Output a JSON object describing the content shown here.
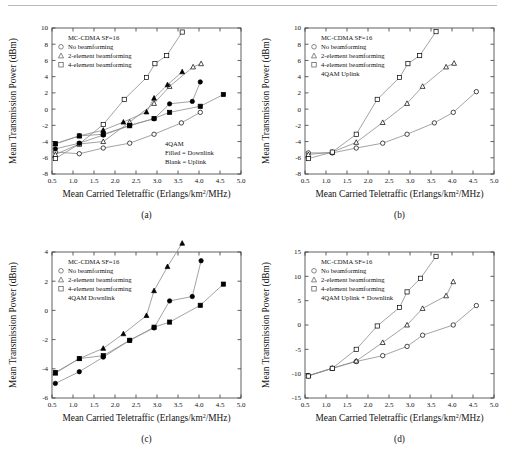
{
  "figure": {
    "axis_x_label": "Mean Carried Teletraffic (Erlangs/km",
    "axis_x_label_sup": "2",
    "axis_x_label_tail": "/MHz)",
    "axis_y_label": "Mean Transmission Power (dBm)",
    "line_color": "#8c8c8c",
    "marker_color": "#000000"
  },
  "panels": [
    {
      "caption": "(a)",
      "legend_title": "MC-CDMA SF=16",
      "legend_items": [
        {
          "marker": "circle-icon",
          "label": "No beamforming"
        },
        {
          "marker": "triangle-icon",
          "label": "2-element beamforming"
        },
        {
          "marker": "square-icon",
          "label": "4-element beamforming"
        }
      ],
      "annotation": [
        "4QAM",
        "Filled = Downlink",
        "Blank = Uplink"
      ],
      "chart_data": {
        "type": "line",
        "title": "(a) 4QAM Filled = Downlink, Blank = Uplink",
        "xlabel": "Mean Carried Teletraffic (Erlangs/km2/MHz)",
        "ylabel": "Mean Transmission Power (dBm)",
        "xlim": [
          0.5,
          5.0
        ],
        "ylim": [
          -8,
          10
        ],
        "xticks": [
          "0.5",
          "1.0",
          "1.5",
          "2.0",
          "2.5",
          "3.0",
          "3.5",
          "4.0",
          "4.5",
          "5.0"
        ],
        "yticks": [
          "-8",
          "-6",
          "-4",
          "-2",
          "0",
          "2",
          "4",
          "6",
          "8",
          "10"
        ],
        "grid": false,
        "legend_position": "top-left",
        "series": [
          {
            "name": "No beamforming (uplink, blank circle)",
            "marker": "circle",
            "fill": "open",
            "points": [
              [
                0.58,
                -5.3
              ],
              [
                1.15,
                -5.5
              ],
              [
                1.72,
                -4.8
              ],
              [
                2.35,
                -4.2
              ],
              [
                2.93,
                -3.1
              ],
              [
                3.58,
                -1.7
              ],
              [
                4.03,
                -0.4
              ]
            ]
          },
          {
            "name": "2-element beamforming (uplink, blank triangle)",
            "marker": "triangle",
            "fill": "open",
            "points": [
              [
                0.58,
                -5.6
              ],
              [
                1.15,
                -4.3
              ],
              [
                1.72,
                -4.0
              ],
              [
                2.35,
                -1.6
              ],
              [
                2.93,
                0.7
              ],
              [
                3.3,
                2.8
              ],
              [
                3.86,
                5.2
              ],
              [
                4.05,
                5.6
              ]
            ]
          },
          {
            "name": "4-element beamforming (uplink, blank square)",
            "marker": "square",
            "fill": "open",
            "points": [
              [
                0.58,
                -6.1
              ],
              [
                1.15,
                -4.3
              ],
              [
                1.72,
                -1.9
              ],
              [
                2.22,
                1.2
              ],
              [
                2.75,
                3.9
              ],
              [
                2.95,
                5.6
              ],
              [
                3.23,
                6.6
              ],
              [
                3.6,
                9.5
              ]
            ]
          },
          {
            "name": "No beamforming (downlink, filled circle)",
            "marker": "circle",
            "fill": "filled",
            "points": [
              [
                0.58,
                -4.9
              ],
              [
                1.15,
                -4.2
              ],
              [
                1.72,
                -3.2
              ],
              [
                2.35,
                -2.0
              ],
              [
                2.93,
                -1.2
              ],
              [
                3.3,
                0.65
              ],
              [
                3.84,
                0.95
              ],
              [
                4.03,
                3.35
              ]
            ]
          },
          {
            "name": "2-element beamforming (downlink, filled triangle)",
            "marker": "triangle",
            "fill": "filled",
            "points": [
              [
                0.58,
                -4.3
              ],
              [
                1.15,
                -3.3
              ],
              [
                1.72,
                -2.6
              ],
              [
                2.2,
                -1.6
              ],
              [
                2.75,
                -0.35
              ],
              [
                2.93,
                1.35
              ],
              [
                3.25,
                3.0
              ],
              [
                3.6,
                4.6
              ]
            ]
          },
          {
            "name": "4-element beamforming (downlink, filled square)",
            "marker": "square",
            "fill": "filled",
            "points": [
              [
                0.58,
                -4.25
              ],
              [
                1.15,
                -3.3
              ],
              [
                1.72,
                -3.1
              ],
              [
                2.35,
                -2.05
              ],
              [
                2.93,
                -1.15
              ],
              [
                3.3,
                -0.4
              ],
              [
                4.03,
                0.35
              ],
              [
                4.58,
                1.8
              ]
            ]
          }
        ]
      }
    },
    {
      "caption": "(b)",
      "legend_title": "MC-CDMA SF=16",
      "legend_items": [
        {
          "marker": "circle-icon",
          "label": "No beamforming"
        },
        {
          "marker": "triangle-icon",
          "label": "2-element beamforming"
        },
        {
          "marker": "square-icon",
          "label": "4-element beamforming"
        }
      ],
      "annotation": [
        "4QAM Uplink"
      ],
      "chart_data": {
        "type": "line",
        "title": "(b) 4QAM Uplink",
        "xlabel": "Mean Carried Teletraffic (Erlangs/km2/MHz)",
        "ylabel": "Mean Transmission Power (dBm)",
        "xlim": [
          0.5,
          5.0
        ],
        "ylim": [
          -8,
          10
        ],
        "xticks": [
          "0.5",
          "1.0",
          "1.5",
          "2.0",
          "2.5",
          "3.0",
          "3.5",
          "4.0",
          "4.5",
          "5.0"
        ],
        "yticks": [
          "-8",
          "-6",
          "-4",
          "-2",
          "0",
          "2",
          "4",
          "6",
          "8",
          "10"
        ],
        "grid": false,
        "legend_position": "top-left",
        "series": [
          {
            "name": "No beamforming",
            "marker": "circle",
            "fill": "open",
            "points": [
              [
                0.58,
                -5.4
              ],
              [
                1.15,
                -5.4
              ],
              [
                1.72,
                -4.8
              ],
              [
                2.35,
                -4.2
              ],
              [
                2.93,
                -3.1
              ],
              [
                3.58,
                -1.7
              ],
              [
                4.03,
                -0.4
              ],
              [
                4.58,
                2.15
              ]
            ]
          },
          {
            "name": "2-element beamforming",
            "marker": "triangle",
            "fill": "open",
            "points": [
              [
                0.58,
                -5.6
              ],
              [
                1.15,
                -5.3
              ],
              [
                1.72,
                -4.1
              ],
              [
                2.35,
                -1.65
              ],
              [
                2.93,
                0.7
              ],
              [
                3.3,
                2.8
              ],
              [
                3.86,
                5.2
              ],
              [
                4.05,
                5.65
              ]
            ]
          },
          {
            "name": "4-element beamforming",
            "marker": "square",
            "fill": "open",
            "points": [
              [
                0.58,
                -6.1
              ],
              [
                1.15,
                -5.3
              ],
              [
                1.72,
                -3.1
              ],
              [
                2.22,
                1.2
              ],
              [
                2.75,
                3.9
              ],
              [
                2.95,
                5.6
              ],
              [
                3.23,
                6.6
              ],
              [
                3.62,
                9.55
              ]
            ]
          }
        ]
      }
    },
    {
      "caption": "(c)",
      "legend_title": "MC-CDMA SF=16",
      "legend_items": [
        {
          "marker": "circle-icon",
          "label": "No beamforming"
        },
        {
          "marker": "triangle-icon",
          "label": "2-element beamforming"
        },
        {
          "marker": "square-icon",
          "label": "4-element beamforming"
        }
      ],
      "annotation": [
        "4QAM Downlink"
      ],
      "chart_data": {
        "type": "line",
        "title": "(c) 4QAM Downlink",
        "xlabel": "Mean Carried Teletraffic (Erlangs/km2/MHz)",
        "ylabel": "Mean Transmission Power (dBm)",
        "xlim": [
          0.5,
          5.0
        ],
        "ylim": [
          -6,
          4
        ],
        "xticks": [
          "0.5",
          "1.0",
          "1.5",
          "2.0",
          "2.5",
          "3.0",
          "3.5",
          "4.0",
          "4.5",
          "5.0"
        ],
        "yticks": [
          "-6",
          "-4",
          "-2",
          "0",
          "2",
          "4"
        ],
        "grid": false,
        "legend_position": "top-left",
        "series": [
          {
            "name": "No beamforming",
            "marker": "circle",
            "fill": "filled",
            "points": [
              [
                0.58,
                -5.0
              ],
              [
                1.15,
                -4.2
              ],
              [
                1.72,
                -3.2
              ],
              [
                2.35,
                -2.05
              ],
              [
                2.93,
                -1.2
              ],
              [
                3.3,
                0.65
              ],
              [
                3.84,
                0.95
              ],
              [
                4.05,
                3.4
              ]
            ]
          },
          {
            "name": "2-element beamforming",
            "marker": "triangle",
            "fill": "filled",
            "points": [
              [
                0.58,
                -4.3
              ],
              [
                1.15,
                -3.3
              ],
              [
                1.72,
                -2.6
              ],
              [
                2.2,
                -1.6
              ],
              [
                2.75,
                -0.35
              ],
              [
                2.93,
                1.35
              ],
              [
                3.25,
                3.0
              ],
              [
                3.6,
                4.6
              ]
            ]
          },
          {
            "name": "4-element beamforming",
            "marker": "square",
            "fill": "filled",
            "points": [
              [
                0.58,
                -4.25
              ],
              [
                1.15,
                -3.3
              ],
              [
                1.72,
                -3.1
              ],
              [
                2.35,
                -2.05
              ],
              [
                2.93,
                -1.15
              ],
              [
                3.3,
                -0.8
              ],
              [
                4.03,
                0.35
              ],
              [
                4.58,
                1.8
              ]
            ]
          }
        ]
      }
    },
    {
      "caption": "(d)",
      "legend_title": "MC-CDMA SF=16",
      "legend_items": [
        {
          "marker": "circle-icon",
          "label": "No beamforming"
        },
        {
          "marker": "triangle-icon",
          "label": "2-element beamforming"
        },
        {
          "marker": "square-icon",
          "label": "4-element beamforming"
        }
      ],
      "annotation": [
        "4QAM Uplink + Downlink"
      ],
      "chart_data": {
        "type": "line",
        "title": "(d) 4QAM Uplink + Downlink",
        "xlabel": "Mean Carried Teletraffic (Erlangs/km2/MHz)",
        "ylabel": "Mean Transmission Power (dBm)",
        "xlim": [
          0.5,
          5.0
        ],
        "ylim": [
          -15,
          15
        ],
        "xticks": [
          "0.5",
          "1.0",
          "1.5",
          "2.0",
          "2.5",
          "3.0",
          "3.5",
          "4.0",
          "4.5",
          "5.0"
        ],
        "yticks": [
          "-15",
          "-10",
          "-5",
          "0",
          "5",
          "10",
          "15"
        ],
        "grid": false,
        "legend_position": "top-left",
        "series": [
          {
            "name": "No beamforming",
            "marker": "circle",
            "fill": "open",
            "points": [
              [
                0.58,
                -10.4
              ],
              [
                1.15,
                -8.9
              ],
              [
                1.72,
                -7.5
              ],
              [
                2.35,
                -6.3
              ],
              [
                2.93,
                -4.4
              ],
              [
                3.3,
                -2.1
              ],
              [
                4.03,
                0.0
              ],
              [
                4.58,
                4.0
              ]
            ]
          },
          {
            "name": "2-element beamforming",
            "marker": "triangle",
            "fill": "open",
            "points": [
              [
                0.58,
                -10.4
              ],
              [
                1.15,
                -8.9
              ],
              [
                1.72,
                -7.4
              ],
              [
                2.35,
                -3.6
              ],
              [
                2.93,
                0.0
              ],
              [
                3.3,
                3.4
              ],
              [
                3.86,
                6.0
              ],
              [
                4.03,
                8.9
              ]
            ]
          },
          {
            "name": "4-element beamforming",
            "marker": "square",
            "fill": "open",
            "points": [
              [
                0.58,
                -10.5
              ],
              [
                1.15,
                -8.9
              ],
              [
                1.72,
                -5.0
              ],
              [
                2.22,
                -0.2
              ],
              [
                2.75,
                3.6
              ],
              [
                2.93,
                6.8
              ],
              [
                3.25,
                9.6
              ],
              [
                3.62,
                14.1
              ]
            ]
          }
        ]
      }
    }
  ]
}
